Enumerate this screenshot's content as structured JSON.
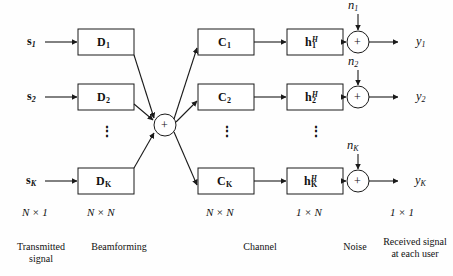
{
  "figure": {
    "type": "block-diagram"
  },
  "signals": {
    "inputs": [
      {
        "name": "s-1",
        "text": "s",
        "sub": "1"
      },
      {
        "name": "s-2",
        "text": "s",
        "sub": "2"
      },
      {
        "name": "s-K",
        "text": "s",
        "sub": "K"
      }
    ],
    "outputs": [
      {
        "name": "y-1",
        "text": "y",
        "sub": "1"
      },
      {
        "name": "y-2",
        "text": "y",
        "sub": "2"
      },
      {
        "name": "y-K",
        "text": "y",
        "sub": "K"
      }
    ],
    "noise": [
      {
        "name": "n-1",
        "text": "n",
        "sub": "1"
      },
      {
        "name": "n-2",
        "text": "n",
        "sub": "2"
      },
      {
        "name": "n-K",
        "text": "n",
        "sub": "K"
      }
    ]
  },
  "blocks": {
    "beamforming": [
      {
        "text": "D",
        "sub": "1"
      },
      {
        "text": "D",
        "sub": "2"
      },
      {
        "text": "D",
        "sub": "K"
      }
    ],
    "channel_c": [
      {
        "text": "C",
        "sub": "1"
      },
      {
        "text": "C",
        "sub": "2"
      },
      {
        "text": "C",
        "sub": "K"
      }
    ],
    "channel_h": [
      {
        "text": "h",
        "sub": "1",
        "sup": "H"
      },
      {
        "text": "h",
        "sub": "2",
        "sup": "H"
      },
      {
        "text": "h",
        "sub": "K",
        "sup": "H"
      }
    ]
  },
  "summing_junction": {
    "symbol": "+"
  },
  "adders": {
    "symbol": "+"
  },
  "dots": {
    "glyph": "⋮"
  },
  "dimensions": [
    {
      "name": "dim-input",
      "value": "N × 1"
    },
    {
      "name": "dim-beamformer",
      "value": "N × N"
    },
    {
      "name": "dim-channel-c",
      "value": "N × N"
    },
    {
      "name": "dim-channel-h",
      "value": "1 × N"
    },
    {
      "name": "dim-output",
      "value": "1 × 1"
    }
  ],
  "captions": [
    {
      "name": "caption-transmitted-signal",
      "line1": "Transmitted",
      "line2": "signal"
    },
    {
      "name": "caption-beamforming",
      "line1": "Beamforming",
      "line2": ""
    },
    {
      "name": "caption-channel",
      "line1": "Channel",
      "line2": ""
    },
    {
      "name": "caption-noise",
      "line1": "Noise",
      "line2": ""
    },
    {
      "name": "caption-received-signal",
      "line1": "Received signal",
      "line2": "at each user"
    }
  ],
  "colors": {
    "stroke": "#1a1a1a",
    "box_fill": "#ffffff",
    "background": "#fefefe",
    "text": "#111111"
  }
}
